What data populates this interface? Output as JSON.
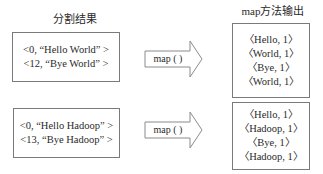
{
  "left": {
    "title": "分割结果",
    "splits": [
      {
        "lines": [
          "<0,  “Hello World” >",
          "<12, “Bye World” >"
        ]
      },
      {
        "lines": [
          "<0,  “Hello Hadoop” >",
          "<13, “Bye Hadoop” >"
        ]
      }
    ]
  },
  "arrows": [
    {
      "label": "map ( )"
    },
    {
      "label": "map ( )"
    }
  ],
  "right": {
    "title": "map方法输出",
    "outputs": [
      {
        "lines": [
          "〈Hello, 1〉",
          "〈World, 1〉",
          "〈Bye, 1〉",
          "〈World, 1〉"
        ]
      },
      {
        "lines": [
          "〈Hello, 1〉",
          "〈Hadoop, 1〉",
          "〈Bye, 1〉",
          "〈Hadoop, 1〉"
        ]
      }
    ]
  }
}
